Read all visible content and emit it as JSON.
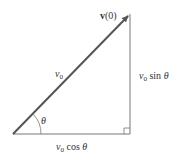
{
  "diagram": {
    "type": "velocity-vector-decomposition",
    "vector_label_bold": "v",
    "vector_label_arg": "(0)",
    "hypotenuse_label": "v",
    "hypotenuse_sub": "0",
    "angle_label": "θ",
    "vertical_label_v": "v",
    "vertical_label_sub": "0",
    "vertical_label_fn": " sin ",
    "vertical_label_angle": "θ",
    "horizontal_label_v": "v",
    "horizontal_label_sub": "0",
    "horizontal_label_fn": " cos ",
    "horizontal_label_angle": "θ",
    "colors": {
      "arrow": "#555555",
      "lines": "#777777",
      "text": "#333333"
    }
  }
}
